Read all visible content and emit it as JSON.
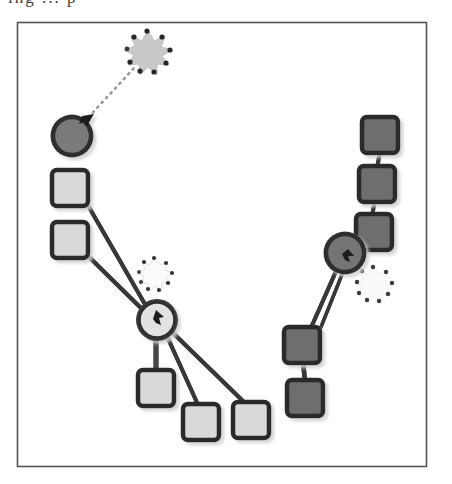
{
  "figure": {
    "title_clipped": "ing ... p",
    "caption": "",
    "frame": {
      "x": 17,
      "y": 22,
      "width": 409,
      "height": 444,
      "border_color": "#555555",
      "border_width": 1.6,
      "fill": "#ffffff"
    },
    "background_color": "#ffffff"
  },
  "palette": {
    "light_fill": "#d9d9d9",
    "light_stroke": "#2e2e2e",
    "dark_fill": "#6e6e6e",
    "dark_stroke": "#2a2a2a",
    "mid_fill": "#8c8c8c",
    "burst_light": "#c7c7c7",
    "burst_pale": "#f2f2f2",
    "burst_dot": "#2b2b2b",
    "edge_color": "#3a3a3a",
    "dotted_edge_color": "#8a8a8a",
    "arrow_color": "#1f1f1f"
  },
  "chart_data": {
    "type": "diagram",
    "title": "",
    "node_shapes": [
      "rounded-square",
      "gear-circle",
      "burst"
    ],
    "clusters": [
      {
        "id": "left-cluster",
        "shade": "light",
        "node_count": 7,
        "hub": "agent-left"
      },
      {
        "id": "right-cluster",
        "shade": "dark",
        "node_count": 6,
        "hub": "agent-right"
      }
    ],
    "nodes": [
      {
        "id": "agent-top-left",
        "label": "",
        "type": "gear-circle",
        "shade": "dark",
        "x": 72,
        "y": 136,
        "r": 20,
        "cluster": "left-cluster",
        "has_pointer": true,
        "pointer_angle": -40
      },
      {
        "id": "burst-top",
        "label": "",
        "type": "burst",
        "shade": "light",
        "x": 148,
        "y": 52,
        "r": 21,
        "cluster": "left-cluster"
      },
      {
        "id": "leaf-l1",
        "label": "",
        "type": "rounded-square",
        "shade": "light",
        "x": 70,
        "y": 188,
        "size": 36,
        "cluster": "left-cluster"
      },
      {
        "id": "leaf-l2",
        "label": "",
        "type": "rounded-square",
        "shade": "light",
        "x": 70,
        "y": 240,
        "size": 36,
        "cluster": "left-cluster"
      },
      {
        "id": "agent-left",
        "label": "",
        "type": "gear-circle",
        "shade": "light",
        "x": 157,
        "y": 320,
        "r": 20,
        "cluster": "left-cluster",
        "has_pointer": true,
        "pointer_angle": -20
      },
      {
        "id": "burst-left",
        "label": "",
        "type": "burst",
        "shade": "pale",
        "x": 155,
        "y": 272,
        "r": 16,
        "cluster": "left-cluster"
      },
      {
        "id": "leaf-l3",
        "label": "",
        "type": "rounded-square",
        "shade": "light",
        "x": 156,
        "y": 388,
        "size": 36,
        "cluster": "left-cluster"
      },
      {
        "id": "leaf-l4",
        "label": "",
        "type": "rounded-square",
        "shade": "light",
        "x": 201,
        "y": 422,
        "size": 36,
        "cluster": "left-cluster"
      },
      {
        "id": "leaf-l5",
        "label": "",
        "type": "rounded-square",
        "shade": "light",
        "x": 251,
        "y": 420,
        "size": 36,
        "cluster": "left-cluster"
      },
      {
        "id": "leaf-r1",
        "label": "",
        "type": "rounded-square",
        "shade": "dark",
        "x": 380,
        "y": 135,
        "size": 36,
        "cluster": "right-cluster"
      },
      {
        "id": "leaf-r2",
        "label": "",
        "type": "rounded-square",
        "shade": "dark",
        "x": 377,
        "y": 184,
        "size": 36,
        "cluster": "right-cluster"
      },
      {
        "id": "leaf-r3",
        "label": "",
        "type": "rounded-square",
        "shade": "dark",
        "x": 374,
        "y": 232,
        "size": 36,
        "cluster": "right-cluster"
      },
      {
        "id": "agent-right",
        "label": "",
        "type": "gear-circle",
        "shade": "dark",
        "x": 345,
        "y": 253,
        "r": 20,
        "cluster": "right-cluster",
        "has_pointer": true,
        "pointer_angle": 150
      },
      {
        "id": "burst-right",
        "label": "",
        "type": "burst",
        "shade": "pale",
        "x": 374,
        "y": 284,
        "r": 17,
        "cluster": "right-cluster"
      },
      {
        "id": "leaf-r4",
        "label": "",
        "type": "rounded-square",
        "shade": "dark",
        "x": 302,
        "y": 345,
        "size": 36,
        "cluster": "right-cluster"
      },
      {
        "id": "leaf-r5",
        "label": "",
        "type": "rounded-square",
        "shade": "dark",
        "x": 305,
        "y": 398,
        "size": 36,
        "cluster": "right-cluster"
      }
    ],
    "edges": [
      {
        "from": "agent-top-left",
        "to": "burst-top",
        "style": "dotted",
        "weight": 1.5
      },
      {
        "from": "leaf-l1",
        "to": "agent-left",
        "style": "solid",
        "weight": 3
      },
      {
        "from": "leaf-l2",
        "to": "agent-left",
        "style": "solid",
        "weight": 3
      },
      {
        "from": "agent-left",
        "to": "leaf-l3",
        "style": "solid",
        "weight": 3
      },
      {
        "from": "agent-left",
        "to": "leaf-l4",
        "style": "solid",
        "weight": 3
      },
      {
        "from": "agent-left",
        "to": "leaf-l5",
        "style": "solid",
        "weight": 3
      },
      {
        "from": "leaf-r1",
        "to": "leaf-r2",
        "style": "solid",
        "weight": 3
      },
      {
        "from": "leaf-r2",
        "to": "leaf-r3",
        "style": "solid",
        "weight": 3
      },
      {
        "from": "leaf-r3",
        "to": "agent-right",
        "style": "solid",
        "weight": 3
      },
      {
        "from": "agent-right",
        "to": "leaf-r4",
        "style": "solid",
        "weight": 3
      },
      {
        "from": "leaf-r4",
        "to": "leaf-r5",
        "style": "solid",
        "weight": 3
      },
      {
        "from": "agent-right",
        "to": "leaf-r5",
        "style": "solid",
        "weight": 3
      }
    ],
    "legend": [],
    "grid": false,
    "axes": false
  }
}
